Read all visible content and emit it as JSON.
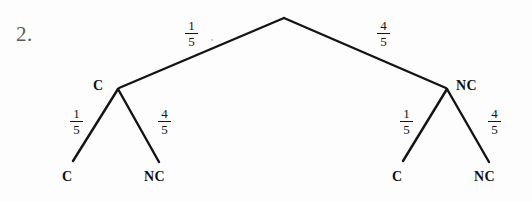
{
  "figure": {
    "problem_number": "2.",
    "type": "probability-tree-diagram"
  },
  "tree": {
    "root": {
      "x": 284,
      "y": 17
    },
    "level1": [
      {
        "id": "left",
        "node_label": "C",
        "probability_numerator": "1",
        "probability_denominator": "5",
        "node_x": 118,
        "node_y": 88
      },
      {
        "id": "right",
        "node_label": "NC",
        "probability_numerator": "4",
        "probability_denominator": "5",
        "node_x": 447,
        "node_y": 88
      }
    ],
    "level2": [
      {
        "id": "left-left",
        "leaf_label": "C",
        "probability_numerator": "1",
        "probability_denominator": "5"
      },
      {
        "id": "left-right",
        "leaf_label": "NC",
        "probability_numerator": "4",
        "probability_denominator": "5"
      },
      {
        "id": "right-left",
        "leaf_label": "C",
        "probability_numerator": "1",
        "probability_denominator": "5"
      },
      {
        "id": "right-right",
        "leaf_label": "NC",
        "probability_numerator": "4",
        "probability_denominator": "5"
      }
    ]
  },
  "colors": {
    "background": "#fdfdfd",
    "ink": "#131313",
    "problem_number_ink": "#59595c"
  }
}
